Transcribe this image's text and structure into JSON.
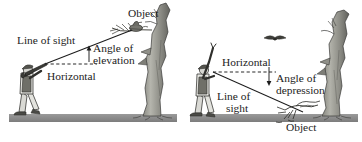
{
  "figure": {
    "background_color": "#ffffff",
    "ink_color": "#1c1c1c",
    "ground_color": "#8c8c8c",
    "tree_color": "#9a9a93",
    "tree_shade_color": "#6e6e68"
  },
  "panels": [
    {
      "id": "elevation",
      "name": "angle-of-elevation-panel",
      "labels": {
        "line_of_sight": "Line of sight",
        "angle_line1": "Angle of",
        "angle_line2": "elevation",
        "horizontal": "Horizontal",
        "object": "Object"
      },
      "elements": {
        "observer": "person-aiming-upward",
        "target": "bird-perched-in-tree",
        "tree": "bare-tree-trunk",
        "sight_line": "solid-line-from-observer-to-bird",
        "horizontal_line": "dashed-horizontal-line",
        "angle_marker": "arrow-pointing-up-at-angle-vertex"
      }
    },
    {
      "id": "depression",
      "name": "angle-of-depression-panel",
      "labels": {
        "horizontal": "Horizontal",
        "angle_line1": "Angle of",
        "angle_line2": "depression",
        "line_of_sight_line1": "Line of",
        "line_of_sight_line2": "sight",
        "object": "Object"
      },
      "elements": {
        "observer": "person-with-raised-arm-looking-down",
        "target": "bird-standing-on-ground",
        "tree": "bare-tree-trunk",
        "flying_bird": "bird-flying-in-sky",
        "sight_line": "solid-line-from-observer-down-to-bird",
        "horizontal_line": "dashed-horizontal-line",
        "angle_marker": "arrow-pointing-down-at-angle-vertex"
      }
    }
  ]
}
